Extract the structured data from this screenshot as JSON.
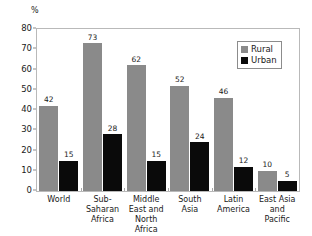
{
  "chart_data": {
    "type": "bar",
    "title": "",
    "subtitle": "",
    "xlabel": "",
    "ylabel": "%",
    "unit_label": "%",
    "ylim": [
      0,
      80
    ],
    "ytick_step": 10,
    "yticks": [
      80,
      70,
      60,
      50,
      40,
      30,
      20,
      10,
      0
    ],
    "grid": false,
    "legend_position": "top-right-inside",
    "categories": [
      "World",
      "Sub-Saharan Africa",
      "Middle East and North Africa",
      "South Asia",
      "Latin America",
      "East Asia and Pacific"
    ],
    "series": [
      {
        "name": "Rural",
        "color": "#8a8a8a",
        "values": [
          42,
          73,
          62,
          52,
          46,
          10
        ]
      },
      {
        "name": "Urban",
        "color": "#0a0a0a",
        "values": [
          15,
          28,
          15,
          24,
          12,
          5
        ]
      }
    ],
    "data_labels": [
      {
        "category": "World",
        "rural": "42",
        "urban": "15"
      },
      {
        "category": "Sub-Saharan Africa",
        "rural": "73",
        "urban": "28"
      },
      {
        "category": "Middle East and North Africa",
        "rural": "62",
        "urban": "15"
      },
      {
        "category": "South Asia",
        "rural": "52",
        "urban": "24"
      },
      {
        "category": "Latin America",
        "rural": "46",
        "urban": "12"
      },
      {
        "category": "East Asia and Pacific",
        "rural": "10",
        "urban": "5"
      }
    ]
  },
  "legend": {
    "items": [
      {
        "label": "Rural",
        "color": "#8a8a8a"
      },
      {
        "label": "Urban",
        "color": "#0a0a0a"
      }
    ]
  },
  "colors": {
    "rural": "#8a8a8a",
    "urban": "#0a0a0a",
    "frame": "#b9b9b9",
    "text": "#1a1a1a",
    "background": "#ffffff"
  }
}
